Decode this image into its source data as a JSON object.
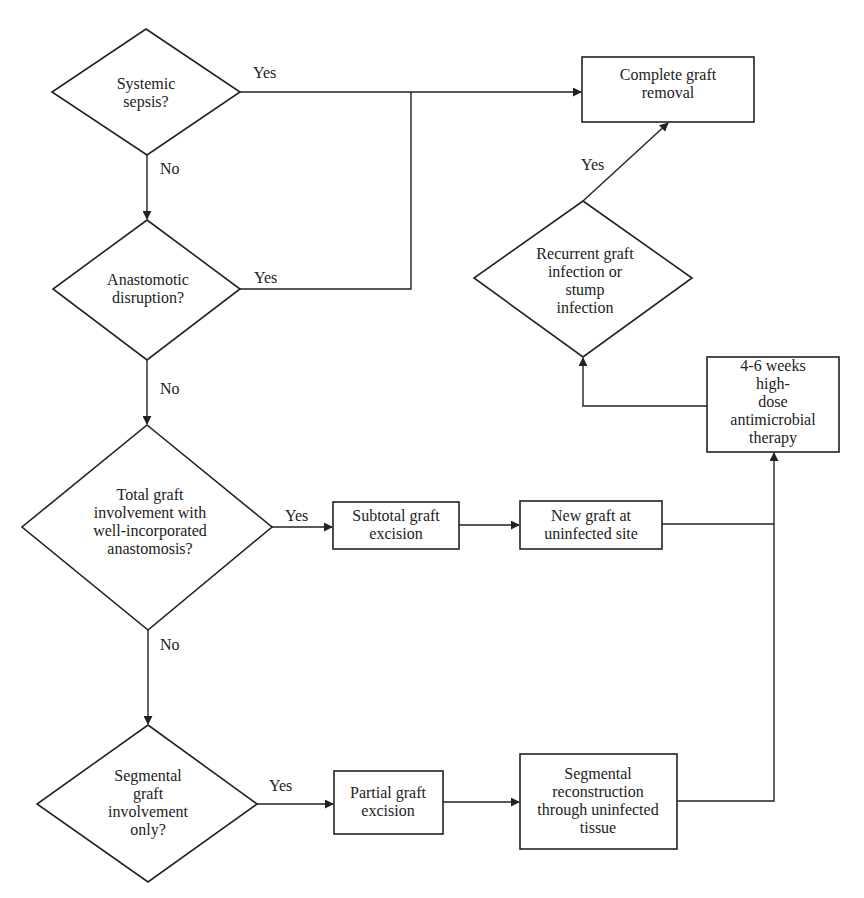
{
  "flowchart": {
    "colors": {
      "stroke": "#222222",
      "background": "#ffffff",
      "text": "#222222"
    },
    "nodes": {
      "systemic_sepsis": {
        "shape": "decision",
        "text": "Systemic\nsepsis?"
      },
      "anastomotic_disruption": {
        "shape": "decision",
        "text": "Anastomotic\ndisruption?"
      },
      "total_graft_involvement": {
        "shape": "decision",
        "text": "Total graft\ninvolvement with\nwell-incorporated\nanastomosis?"
      },
      "segmental_graft_involvement": {
        "shape": "decision",
        "text": "Segmental\ngraft\ninvolvement\nonly?"
      },
      "complete_graft_removal": {
        "shape": "process",
        "text": "Complete graft\nremoval"
      },
      "recurrent_infection": {
        "shape": "decision",
        "text": "Recurrent graft\ninfection or\nstump\ninfection"
      },
      "antimicrobial_therapy": {
        "shape": "process",
        "text": "4-6 weeks high-\ndose\nantimicrobial\ntherapy"
      },
      "subtotal_graft_excision": {
        "shape": "process",
        "text": "Subtotal graft\nexcision"
      },
      "new_graft": {
        "shape": "process",
        "text": "New graft at\nuninfected site"
      },
      "partial_graft_excision": {
        "shape": "process",
        "text": "Partial graft\nexcision"
      },
      "segmental_reconstruction": {
        "shape": "process",
        "text": "Segmental\nreconstruction\nthrough uninfected\ntissue"
      }
    },
    "edges": [
      {
        "from": "systemic_sepsis",
        "to": "complete_graft_removal",
        "label": "Yes"
      },
      {
        "from": "systemic_sepsis",
        "to": "anastomotic_disruption",
        "label": "No"
      },
      {
        "from": "anastomotic_disruption",
        "to": "complete_graft_removal",
        "label": "Yes"
      },
      {
        "from": "anastomotic_disruption",
        "to": "total_graft_involvement",
        "label": "No"
      },
      {
        "from": "total_graft_involvement",
        "to": "subtotal_graft_excision",
        "label": "Yes"
      },
      {
        "from": "total_graft_involvement",
        "to": "segmental_graft_involvement",
        "label": "No"
      },
      {
        "from": "subtotal_graft_excision",
        "to": "new_graft",
        "label": ""
      },
      {
        "from": "new_graft",
        "to": "antimicrobial_therapy",
        "label": ""
      },
      {
        "from": "segmental_graft_involvement",
        "to": "partial_graft_excision",
        "label": "Yes"
      },
      {
        "from": "partial_graft_excision",
        "to": "segmental_reconstruction",
        "label": ""
      },
      {
        "from": "segmental_reconstruction",
        "to": "antimicrobial_therapy",
        "label": ""
      },
      {
        "from": "antimicrobial_therapy",
        "to": "recurrent_infection",
        "label": ""
      },
      {
        "from": "recurrent_infection",
        "to": "complete_graft_removal",
        "label": "Yes"
      }
    ],
    "edge_labels": {
      "sepsis_yes": "Yes",
      "sepsis_no": "No",
      "disruption_yes": "Yes",
      "disruption_no": "No",
      "total_yes": "Yes",
      "total_no": "No",
      "segmental_yes": "Yes",
      "recurrent_yes": "Yes"
    }
  }
}
